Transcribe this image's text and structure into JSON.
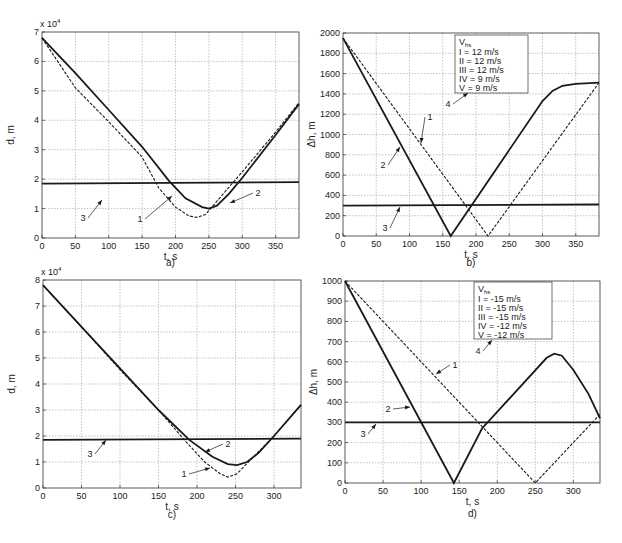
{
  "figure": {
    "panels": [
      "a)",
      "b)",
      "c)",
      "d)"
    ]
  },
  "chart_data": [
    {
      "id": "a",
      "type": "line",
      "panel_label": "a)",
      "xlabel": "t, s",
      "ylabel": "d, m",
      "y_multiplier": "x 10^4",
      "xlim": [
        0,
        385
      ],
      "ylim": [
        0,
        7
      ],
      "xticks": [
        0,
        50,
        100,
        150,
        200,
        250,
        300,
        350
      ],
      "yticks": [
        0,
        1,
        2,
        3,
        4,
        5,
        6,
        7
      ],
      "grid": true,
      "series": [
        {
          "name": "1",
          "style": "dashed",
          "points": [
            [
              0,
              6.8
            ],
            [
              50,
              5.1
            ],
            [
              100,
              3.95
            ],
            [
              150,
              2.75
            ],
            [
              175,
              1.7
            ],
            [
              200,
              1.05
            ],
            [
              220,
              0.75
            ],
            [
              232,
              0.7
            ],
            [
              245,
              0.8
            ],
            [
              260,
              1.2
            ],
            [
              300,
              2.25
            ],
            [
              350,
              3.6
            ],
            [
              385,
              4.6
            ]
          ]
        },
        {
          "name": "2",
          "style": "solid",
          "points": [
            [
              0,
              6.8
            ],
            [
              50,
              5.6
            ],
            [
              100,
              4.35
            ],
            [
              150,
              3.1
            ],
            [
              190,
              1.95
            ],
            [
              215,
              1.35
            ],
            [
              240,
              1.05
            ],
            [
              250,
              1.0
            ],
            [
              262,
              1.1
            ],
            [
              280,
              1.5
            ],
            [
              300,
              2.05
            ],
            [
              350,
              3.5
            ],
            [
              385,
              4.55
            ]
          ]
        },
        {
          "name": "3",
          "style": "solid",
          "points": [
            [
              0,
              1.85
            ],
            [
              385,
              1.9
            ]
          ]
        }
      ],
      "annotations": [
        "1",
        "2",
        "3"
      ]
    },
    {
      "id": "b",
      "type": "line",
      "panel_label": "b)",
      "xlabel": "t, s",
      "ylabel": "Δh, m",
      "xlim": [
        0,
        385
      ],
      "ylim": [
        0,
        2000
      ],
      "xticks": [
        0,
        50,
        100,
        150,
        200,
        250,
        300,
        350
      ],
      "yticks": [
        0,
        200,
        400,
        600,
        800,
        1000,
        1200,
        1400,
        1600,
        1800,
        2000
      ],
      "grid": true,
      "legend": {
        "title": "V_hs",
        "entries": [
          "I = 12 m/s",
          "II = 12 m/s",
          "III = 12 m/s",
          "IV = 9 m/s",
          "V = 9 m/s"
        ]
      },
      "series": [
        {
          "name": "1",
          "style": "dashed",
          "points": [
            [
              0,
              1950
            ],
            [
              218,
              0
            ],
            [
              385,
              1510
            ]
          ]
        },
        {
          "name": "2",
          "style": "solid",
          "points": [
            [
              0,
              1950
            ],
            [
              162,
              0
            ],
            [
              300,
              1330
            ],
            [
              315,
              1430
            ],
            [
              330,
              1480
            ],
            [
              350,
              1500
            ],
            [
              385,
              1510
            ]
          ]
        },
        {
          "name": "3",
          "style": "solid",
          "points": [
            [
              0,
              300
            ],
            [
              385,
              310
            ]
          ]
        }
      ],
      "annotations": [
        "1",
        "2",
        "3",
        "4"
      ]
    },
    {
      "id": "c",
      "type": "line",
      "panel_label": "c)",
      "xlabel": "t, s",
      "ylabel": "d, m",
      "y_multiplier": "x 10^4",
      "xlim": [
        0,
        335
      ],
      "ylim": [
        0,
        8
      ],
      "xticks": [
        0,
        50,
        100,
        150,
        200,
        250,
        300
      ],
      "yticks": [
        0,
        1,
        2,
        3,
        4,
        5,
        6,
        7,
        8
      ],
      "grid": true,
      "series": [
        {
          "name": "1",
          "style": "dashed",
          "points": [
            [
              0,
              7.8
            ],
            [
              50,
              6.2
            ],
            [
              100,
              4.55
            ],
            [
              150,
              3.0
            ],
            [
              185,
              1.8
            ],
            [
              210,
              1.0
            ],
            [
              230,
              0.55
            ],
            [
              240,
              0.42
            ],
            [
              252,
              0.55
            ],
            [
              270,
              1.1
            ],
            [
              300,
              2.0
            ],
            [
              335,
              3.2
            ]
          ]
        },
        {
          "name": "2",
          "style": "solid",
          "points": [
            [
              0,
              7.8
            ],
            [
              50,
              6.2
            ],
            [
              100,
              4.6
            ],
            [
              150,
              3.0
            ],
            [
              190,
              1.85
            ],
            [
              220,
              1.2
            ],
            [
              240,
              0.92
            ],
            [
              252,
              0.88
            ],
            [
              265,
              1.0
            ],
            [
              280,
              1.35
            ],
            [
              300,
              2.0
            ],
            [
              335,
              3.2
            ]
          ]
        },
        {
          "name": "3",
          "style": "solid",
          "points": [
            [
              0,
              1.85
            ],
            [
              335,
              1.9
            ]
          ]
        }
      ],
      "annotations": [
        "1",
        "2",
        "3"
      ]
    },
    {
      "id": "d",
      "type": "line",
      "panel_label": "d)",
      "xlabel": "t, s",
      "ylabel": "Δh, m",
      "xlim": [
        0,
        335
      ],
      "ylim": [
        0,
        1000
      ],
      "xticks": [
        0,
        50,
        100,
        150,
        200,
        250,
        300
      ],
      "yticks": [
        0,
        100,
        200,
        300,
        400,
        500,
        600,
        700,
        800,
        900,
        1000
      ],
      "grid": true,
      "legend": {
        "title": "V_hs",
        "entries": [
          "I = -15 m/s",
          "II = -15 m/s",
          "III = -15 m/s",
          "IV = -12 m/s",
          "V = -12 m/s"
        ]
      },
      "series": [
        {
          "name": "1",
          "style": "dashed",
          "points": [
            [
              0,
              1000
            ],
            [
              250,
              0
            ],
            [
              335,
              340
            ]
          ]
        },
        {
          "name": "2",
          "style": "solid",
          "points": [
            [
              0,
              1000
            ],
            [
              143,
              0
            ],
            [
              180,
              270
            ],
            [
              265,
              620
            ],
            [
              275,
              640
            ],
            [
              285,
              630
            ],
            [
              300,
              560
            ],
            [
              320,
              440
            ],
            [
              335,
              320
            ]
          ]
        },
        {
          "name": "3",
          "style": "solid",
          "points": [
            [
              0,
              300
            ],
            [
              335,
              300
            ]
          ]
        }
      ],
      "annotations": [
        "1",
        "2",
        "3",
        "4"
      ]
    }
  ]
}
